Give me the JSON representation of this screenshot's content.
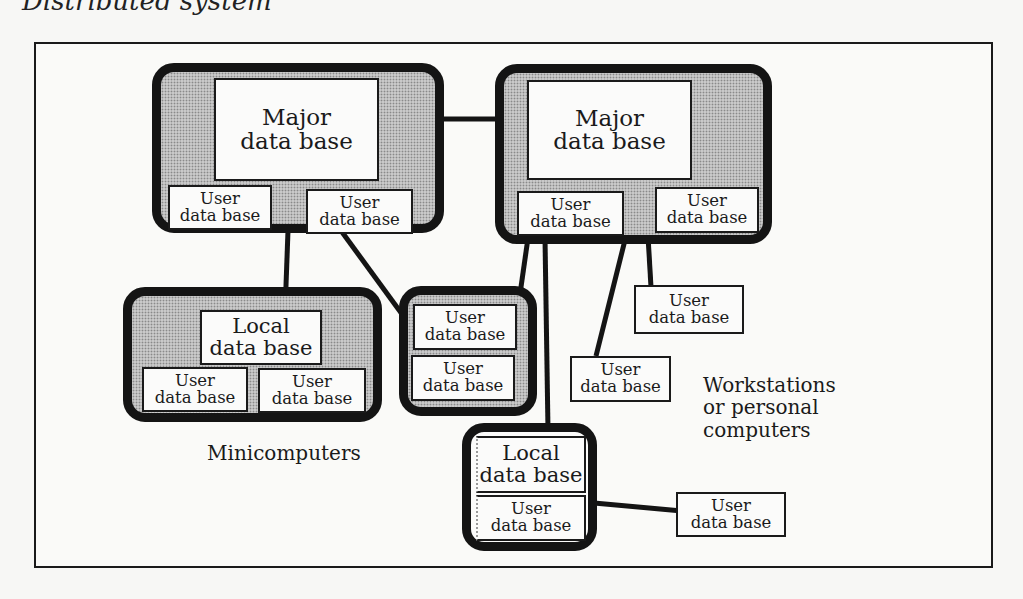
{
  "caption": "Distributed system",
  "diagram": {
    "major_db_1": {
      "line1": "Major",
      "line2": "data base"
    },
    "major_db_2": {
      "line1": "Major",
      "line2": "data base"
    },
    "local_db_1": {
      "line1": "Local",
      "line2": "data base"
    },
    "local_db_2": {
      "line1": "Local",
      "line2": "data base"
    },
    "user_db": {
      "line1": "User",
      "line2": "data base"
    },
    "labels": {
      "minicomputers": "Minicomputers",
      "workstations_line1": "Workstations",
      "workstations_line2": "or personal",
      "workstations_line3": "computers"
    }
  }
}
